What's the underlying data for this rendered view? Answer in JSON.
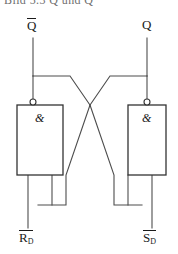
{
  "figure": {
    "background_color": "#ffffff",
    "line_color": "#4d4d4d",
    "text_color": "#1a1a1a",
    "width": 178,
    "height": 254
  },
  "clipped_header": {
    "text": "Bild 5.3  Q und Q",
    "visible": "partially cut off at top edge"
  },
  "terminals": {
    "top_left": {
      "label": "Q",
      "overbar": true,
      "x": 33,
      "y": 26
    },
    "top_right": {
      "label": "Q",
      "overbar": false,
      "x": 147,
      "y": 26
    },
    "bottom_left": {
      "label": "R",
      "subscript": "D",
      "overbar": true,
      "x": 27,
      "y": 238
    },
    "bottom_right": {
      "label": "S",
      "subscript": "D",
      "overbar": true,
      "x": 141,
      "y": 238
    }
  },
  "gates": [
    {
      "name": "nand-gate-left",
      "symbol": "&",
      "type": "NAND",
      "box": {
        "x": 17,
        "y": 105,
        "width": 46,
        "height": 70
      },
      "inversion_bubble": {
        "cx": 33,
        "cy": 102,
        "r": 3,
        "position": "top"
      }
    },
    {
      "name": "nand-gate-right",
      "symbol": "&",
      "type": "NAND",
      "box": {
        "x": 128,
        "y": 105,
        "width": 38,
        "height": 70
      },
      "inversion_bubble": {
        "cx": 147,
        "cy": 102,
        "r": 3,
        "position": "top"
      }
    }
  ],
  "junctions": [
    {
      "name": "junction-left",
      "x": 33,
      "y": 76
    },
    {
      "name": "junction-right",
      "x": 147,
      "y": 76
    }
  ],
  "wires": {
    "top_left_stem": "Q-bar terminal down to left junction",
    "top_right_stem": "Q terminal down to right junction",
    "left_feedback": "left junction right then diagonally down to right gate inner input",
    "right_feedback": "right junction left then diagonally down to left gate inner input",
    "left_outer_input": "left gate outer input straight down to R-bar-D",
    "right_outer_input": "right gate outer input straight down to S-bar-D"
  }
}
